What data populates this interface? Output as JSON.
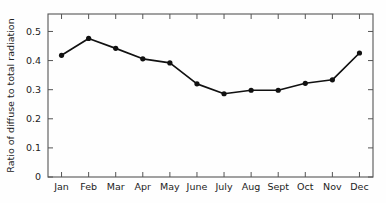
{
  "chart_data": {
    "type": "line",
    "title": "",
    "xlabel": "",
    "ylabel": "Ratio of diffuse to total radiation",
    "categories": [
      "Jan",
      "Feb",
      "Mar",
      "Apr",
      "May",
      "June",
      "July",
      "Aug",
      "Sept",
      "Oct",
      "Nov",
      "Dec"
    ],
    "values": [
      0.418,
      0.476,
      0.442,
      0.406,
      0.392,
      0.32,
      0.286,
      0.298,
      0.298,
      0.322,
      0.334,
      0.426
    ],
    "series": [
      {
        "name": "Ratio of diffuse to total radiation",
        "values": [
          0.418,
          0.476,
          0.442,
          0.406,
          0.392,
          0.32,
          0.286,
          0.298,
          0.298,
          0.322,
          0.334,
          0.426
        ]
      }
    ],
    "ylim": [
      0,
      0.56
    ],
    "ytick_labels": [
      "0",
      "0.1",
      "0.2",
      "0.3",
      "0.4",
      "0.5"
    ],
    "ytick_values": [
      0,
      0.1,
      0.2,
      0.3,
      0.4,
      0.5
    ],
    "grid": false,
    "legend": false,
    "legend_position": "none",
    "marker": "filled-circle",
    "line_color": "#111111",
    "marker_color": "#111111",
    "frame_color": "#555555",
    "background_color": "#fefefe"
  }
}
